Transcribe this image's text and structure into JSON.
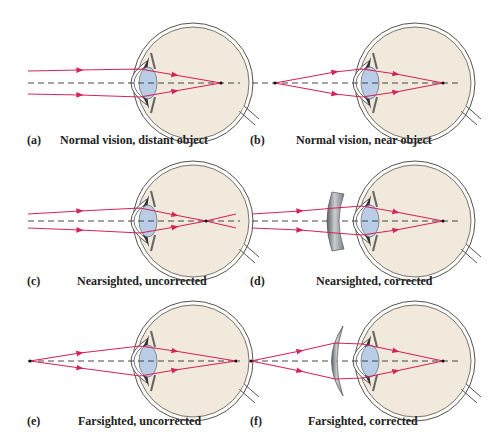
{
  "figure": {
    "panels": [
      {
        "id": "a",
        "tag": "(a)",
        "caption": "Normal vision, distant object"
      },
      {
        "id": "b",
        "tag": "(b)",
        "caption": "Normal vision, near object"
      },
      {
        "id": "c",
        "tag": "(c)",
        "caption": "Nearsighted, uncorrected"
      },
      {
        "id": "d",
        "tag": "(d)",
        "caption": "Nearsighted, corrected"
      },
      {
        "id": "e",
        "tag": "(e)",
        "caption": "Farsighted, uncorrected"
      },
      {
        "id": "f",
        "tag": "(f)",
        "caption": "Farsighted, corrected"
      }
    ],
    "colors": {
      "ray": "#d4245a",
      "eyeball_fill": "#f1e9dc",
      "eye_outline": "#555555",
      "lens_fill": "#b9cde6",
      "corrective_lens": "#8a8d92",
      "axis": "#333333"
    }
  }
}
